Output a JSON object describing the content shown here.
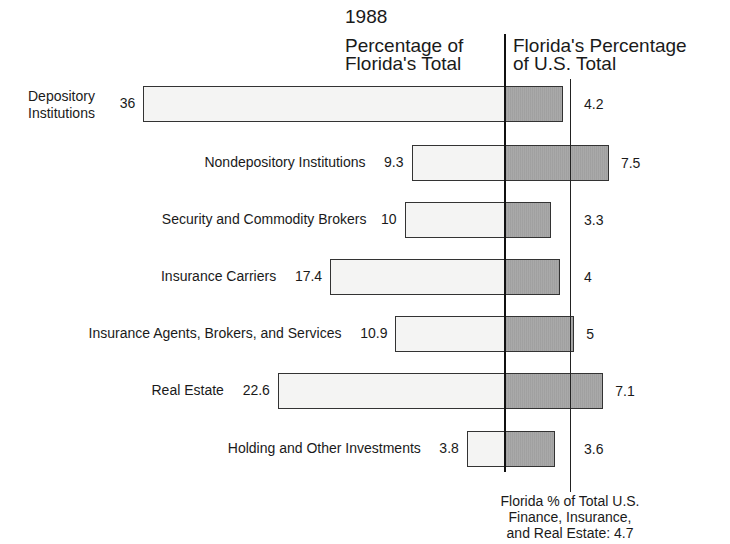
{
  "chart_data": {
    "type": "bar",
    "orientation": "horizontal",
    "title": "1988",
    "left_panel_header": "Percentage of\nFlorida's Total",
    "right_panel_header": "Florida's Percentage\nof U.S. Total",
    "categories": [
      "Depository Institutions",
      "Nondepository Institutions",
      "Security and Commodity Brokers",
      "Insurance Carriers",
      "Insurance Agents, Brokers, and Services",
      "Real Estate",
      "Holding and Other Investments"
    ],
    "series": [
      {
        "name": "Percentage of Florida's Total",
        "values": [
          36,
          9.3,
          10,
          17.4,
          10.9,
          22.6,
          3.8
        ],
        "color": "#f4f4f3"
      },
      {
        "name": "Florida's Percentage of U.S. Total",
        "values": [
          4.2,
          7.5,
          3.3,
          4,
          5,
          7.1,
          3.6
        ],
        "color": "#a9a9a9"
      }
    ],
    "reference_line": {
      "value": 4.7,
      "label": "Florida % of Total U.S.\nFinance, Insurance,\nand Real Estate: 4.7"
    },
    "grid": false,
    "legend": "none"
  },
  "labels": {
    "year": "1988",
    "left_header": "Percentage of\nFlorida's Total",
    "right_header": "Florida's Percentage\nof U.S. Total",
    "note": "Florida % of Total U.S.\nFinance, Insurance,\nand Real Estate: 4.7"
  },
  "rows": [
    {
      "label": "Depository\nInstitutions",
      "left": "36",
      "right": "4.2"
    },
    {
      "label": "Nondepository Institutions",
      "left": "9.3",
      "right": "7.5"
    },
    {
      "label": "Security and Commodity Brokers",
      "left": "10",
      "right": "3.3"
    },
    {
      "label": "Insurance Carriers",
      "left": "17.4",
      "right": "4"
    },
    {
      "label": "Insurance Agents, Brokers, and Services",
      "left": "10.9",
      "right": "5"
    },
    {
      "label": "Real Estate",
      "left": "22.6",
      "right": "7.1"
    },
    {
      "label": "Holding and Other Investments",
      "left": "3.8",
      "right": "3.6"
    }
  ]
}
